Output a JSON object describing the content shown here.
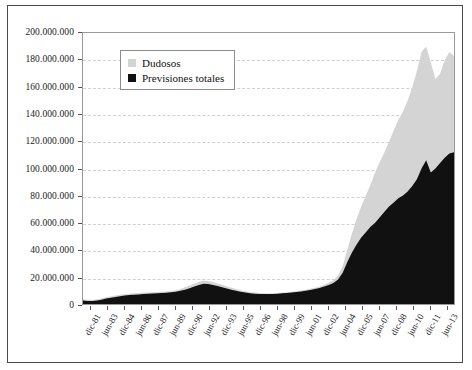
{
  "chart_data": {
    "type": "area",
    "title": "",
    "xlabel": "",
    "ylabel": "",
    "ylim": [
      0,
      200000000
    ],
    "grid": true,
    "legend_position": "top-left-inside",
    "y_ticks": [
      "0",
      "20.000.000",
      "40.000.000",
      "60.000.000",
      "80.000.000",
      "100.000.000",
      "120.000.000",
      "140.000.000",
      "160.000.000",
      "180.000.000",
      "200.000.000"
    ],
    "y_tick_values": [
      0,
      20000000,
      40000000,
      60000000,
      80000000,
      100000000,
      120000000,
      140000000,
      160000000,
      180000000,
      200000000
    ],
    "categories": [
      "dic-81",
      "jun-83",
      "dic-84",
      "jun-86",
      "dic-87",
      "jun-89",
      "dic-90",
      "jun-92",
      "dic-93",
      "jun-95",
      "dic-96",
      "jun-98",
      "dic-99",
      "jun-01",
      "dic-02",
      "jun-04",
      "dic-05",
      "jun-07",
      "dic-08",
      "jun-10",
      "dic-11",
      "jun-13"
    ],
    "colors": {
      "dudosos": "#d4d4d4",
      "previsiones": "#111111",
      "grid": "#d0d0d0",
      "axis": "#9a9a9a",
      "frame": "#4a4a4a"
    },
    "series": [
      {
        "name": "Dudosos",
        "color": "#d4d4d4",
        "x": [
          "dic-81",
          "jun-83",
          "dic-84",
          "jun-86",
          "dic-87",
          "jun-89",
          "dic-90",
          "jun-92",
          "dic-93",
          "jun-95",
          "dic-96",
          "jun-98",
          "dic-99",
          "jun-01",
          "dic-02",
          "jun-04",
          "dic-05",
          "jun-07",
          "dic-08",
          "jun-10",
          "dic-11",
          "jun-13"
        ],
        "values": [
          3500000,
          5500000,
          7000000,
          8000000,
          8500000,
          9000000,
          9500000,
          12000000,
          17000000,
          15000000,
          11000000,
          8500000,
          8000000,
          8500000,
          9500000,
          11000000,
          13000000,
          17000000,
          40000000,
          97000000,
          140000000,
          183000000
        ]
      },
      {
        "name": "Previsiones totales",
        "color": "#111111",
        "x": [
          "dic-81",
          "jun-83",
          "dic-84",
          "jun-86",
          "dic-87",
          "jun-89",
          "dic-90",
          "jun-92",
          "dic-93",
          "jun-95",
          "dic-96",
          "jun-98",
          "dic-99",
          "jun-01",
          "dic-02",
          "jun-04",
          "dic-05",
          "jun-07",
          "dic-08",
          "jun-10",
          "dic-11",
          "jun-13"
        ],
        "values": [
          2500000,
          4500000,
          6000000,
          7000000,
          7500000,
          8000000,
          8500000,
          10500000,
          14500000,
          13000000,
          10000000,
          8000000,
          7500000,
          8000000,
          9000000,
          10500000,
          12500000,
          16000000,
          31000000,
          60000000,
          82000000,
          112000000
        ]
      }
    ],
    "dudosos_dense": [
      3.5,
      3.2,
      3.0,
      3.4,
      4.2,
      5.0,
      5.6,
      6.2,
      6.8,
      7.2,
      7.6,
      7.9,
      8.1,
      8.3,
      8.5,
      8.7,
      8.9,
      9.1,
      9.3,
      9.6,
      10.2,
      11.1,
      12.3,
      13.6,
      15.0,
      16.4,
      17.3,
      17.0,
      16.2,
      15.2,
      14.2,
      13.1,
      12.0,
      11.0,
      10.2,
      9.4,
      8.8,
      8.4,
      8.1,
      7.9,
      7.8,
      7.9,
      8.1,
      8.4,
      8.7,
      9.0,
      9.4,
      9.9,
      10.5,
      11.2,
      12.0,
      13.0,
      14.2,
      15.8,
      17.5,
      21.0,
      28.0,
      40.0,
      52.0,
      63.0,
      72.0,
      80.0,
      88.0,
      97.0,
      105.0,
      112.0,
      120.0,
      128.0,
      136.0,
      142.0,
      150.0,
      160.0,
      172.0,
      186.0,
      190.0,
      178.0,
      166.0,
      170.0,
      180.0,
      186.0,
      183.0
    ],
    "previsiones_dense": [
      2.5,
      2.3,
      2.2,
      2.5,
      3.2,
      4.0,
      4.6,
      5.2,
      5.8,
      6.2,
      6.6,
      6.9,
      7.1,
      7.3,
      7.5,
      7.7,
      7.9,
      8.1,
      8.3,
      8.6,
      9.0,
      9.7,
      10.6,
      11.7,
      12.9,
      14.1,
      14.9,
      14.7,
      14.0,
      13.2,
      12.3,
      11.4,
      10.5,
      9.7,
      9.0,
      8.4,
      7.9,
      7.6,
      7.4,
      7.3,
      7.3,
      7.4,
      7.6,
      7.9,
      8.2,
      8.5,
      8.9,
      9.3,
      9.8,
      10.4,
      11.1,
      11.9,
      12.9,
      14.1,
      15.5,
      18.0,
      23.0,
      31.0,
      38.0,
      44.0,
      49.0,
      53.0,
      57.0,
      60.0,
      64.0,
      68.0,
      72.0,
      75.0,
      78.0,
      80.0,
      83.0,
      87.0,
      92.0,
      100.0,
      106.0,
      97.0,
      100.0,
      104.0,
      108.0,
      111.0,
      112.0
    ]
  },
  "legend": {
    "items": [
      {
        "label": "Dudosos",
        "color": "#d4d4d4"
      },
      {
        "label": "Previsiones totales",
        "color": "#111111"
      }
    ]
  }
}
